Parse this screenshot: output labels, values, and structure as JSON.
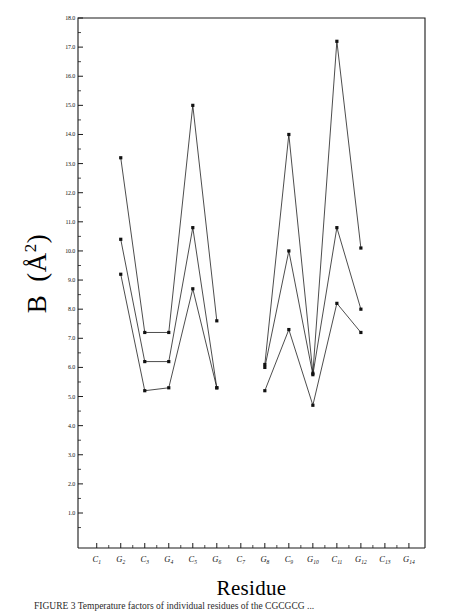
{
  "chart_data": {
    "type": "line",
    "title": "",
    "xlabel": "Residue",
    "ylabel": "B  (Å2)",
    "ylabel_parts": {
      "symbol": "B",
      "unit_open": "(",
      "unit_angstrom": "Å",
      "unit_exp": "2",
      "unit_close": ")"
    },
    "categories": [
      "C1",
      "G2",
      "C3",
      "G4",
      "C5",
      "G6",
      "C7",
      "G8",
      "C9",
      "G10",
      "C11",
      "G12",
      "C13",
      "G14"
    ],
    "category_labels": [
      {
        "base": "C",
        "sub": "1"
      },
      {
        "base": "G",
        "sub": "2"
      },
      {
        "base": "C",
        "sub": "3"
      },
      {
        "base": "G",
        "sub": "4"
      },
      {
        "base": "C",
        "sub": "5"
      },
      {
        "base": "G",
        "sub": "6"
      },
      {
        "base": "C",
        "sub": "7"
      },
      {
        "base": "G",
        "sub": "8"
      },
      {
        "base": "C",
        "sub": "9"
      },
      {
        "base": "G",
        "sub": "10"
      },
      {
        "base": "C",
        "sub": "11"
      },
      {
        "base": "G",
        "sub": "12"
      },
      {
        "base": "C",
        "sub": "13"
      },
      {
        "base": "G",
        "sub": "14"
      }
    ],
    "ylim": [
      0.5,
      18.0
    ],
    "yticks": [
      18.0,
      17.0,
      16.0,
      15.0,
      14.0,
      13.0,
      12.0,
      11.0,
      10.0,
      9.0,
      8.0,
      7.0,
      6.0,
      5.0,
      4.0,
      3.0,
      2.0,
      1.0
    ],
    "ytick_labels": [
      "18.0",
      "17.0",
      "16.0",
      "15.0",
      "14.0",
      "13.0",
      "12.0",
      "11.0",
      "10.0",
      "9.0",
      "8.0",
      "7.0",
      "6.0",
      "5.0",
      "4.0",
      "3.0",
      "2.0",
      "1.0"
    ],
    "yminor_step": 0.5,
    "grid": false,
    "legend": "none",
    "marker": "filled-square",
    "series": [
      {
        "name": "series-1",
        "points": [
          {
            "x": "G2",
            "y": 13.2
          },
          {
            "x": "C3",
            "y": 7.2
          },
          {
            "x": "G4",
            "y": 7.2
          },
          {
            "x": "C5",
            "y": 15.0
          },
          {
            "x": "G6",
            "y": 7.6
          }
        ]
      },
      {
        "name": "series-2",
        "points": [
          {
            "x": "G2",
            "y": 10.4
          },
          {
            "x": "C3",
            "y": 6.2
          },
          {
            "x": "G4",
            "y": 6.2
          },
          {
            "x": "C5",
            "y": 10.8
          },
          {
            "x": "G6",
            "y": 5.3
          }
        ]
      },
      {
        "name": "series-3",
        "points": [
          {
            "x": "G2",
            "y": 9.2
          },
          {
            "x": "C3",
            "y": 5.2
          },
          {
            "x": "G4",
            "y": 5.3
          },
          {
            "x": "C5",
            "y": 8.7
          },
          {
            "x": "G6",
            "y": 5.3
          }
        ]
      },
      {
        "name": "series-4",
        "points": [
          {
            "x": "G8",
            "y": 6.1
          },
          {
            "x": "C9",
            "y": 14.0
          },
          {
            "x": "G10",
            "y": 5.8
          },
          {
            "x": "C11",
            "y": 17.2
          },
          {
            "x": "G12",
            "y": 10.1
          }
        ]
      },
      {
        "name": "series-5",
        "points": [
          {
            "x": "G8",
            "y": 6.0
          },
          {
            "x": "C9",
            "y": 10.0
          },
          {
            "x": "G10",
            "y": 5.75
          },
          {
            "x": "C11",
            "y": 10.8
          },
          {
            "x": "G12",
            "y": 8.0
          }
        ]
      },
      {
        "name": "series-6",
        "points": [
          {
            "x": "G8",
            "y": 5.2
          },
          {
            "x": "C9",
            "y": 7.3
          },
          {
            "x": "G10",
            "y": 4.7
          },
          {
            "x": "C11",
            "y": 8.2
          },
          {
            "x": "G12",
            "y": 7.2
          }
        ]
      }
    ]
  },
  "axis": {
    "x_title": "Residue",
    "y_title": "B  (Å2)"
  },
  "caption": {
    "label": "FIGURE 3",
    "text": "FIGURE 3  Temperature factors of individual residues of the CGCGCG ..."
  }
}
